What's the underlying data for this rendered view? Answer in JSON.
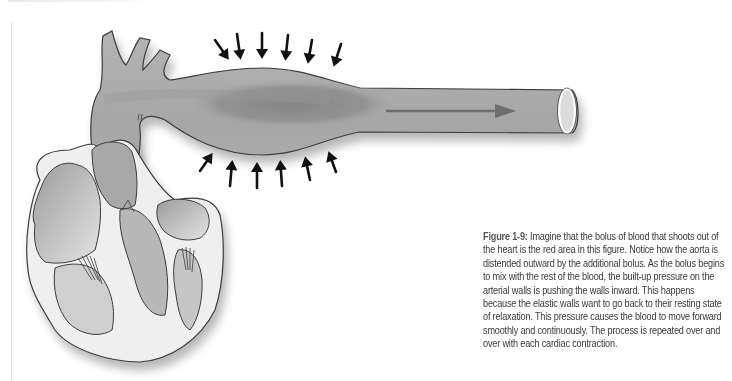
{
  "figure": {
    "label": "Figure 1-9:",
    "caption": " Imagine that the bolus of blood that shoots out of the heart is the red area in this figure. Notice how the aorta is distended outward by the additional bolus. As the bolus begins to mix with the rest of the blood, the built-up pressure on the arterial walls is pushing the walls inward. This happens because the elastic walls want to go back to their resting state of relaxation. This pressure causes the blood to move forward smoothly and continuously. The process is repeated over and over with each cardiac contraction."
  },
  "diagram": {
    "elements": [
      {
        "name": "heart",
        "icon": "heart-cross-section"
      },
      {
        "name": "aortic-arch",
        "icon": "vessel"
      },
      {
        "name": "distended-bolus-region",
        "icon": "bolus"
      },
      {
        "name": "inward-pressure-arrows-top",
        "count": 6,
        "direction": "down"
      },
      {
        "name": "inward-pressure-arrows-bottom",
        "count": 6,
        "direction": "up"
      },
      {
        "name": "blood-flow-arrow",
        "direction": "right"
      }
    ],
    "colors": {
      "vessel": "#a9a9a9",
      "bolus": "#8c8c8c",
      "outline": "#3c3c3c",
      "arrow": "#111111",
      "flow_arrow": "#6e6e6e",
      "heart_fill": "#ececec"
    }
  }
}
